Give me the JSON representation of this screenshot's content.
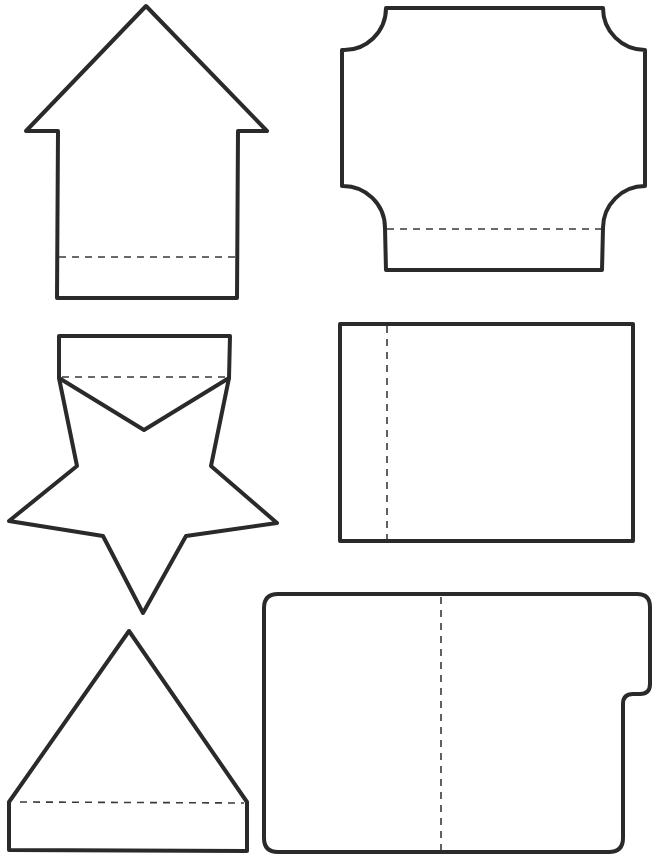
{
  "page": {
    "width": 652,
    "height": 854,
    "background": "#ffffff",
    "line_color": "#2a2a2a",
    "fold_color": "#3a3a3a"
  },
  "shapes": [
    {
      "name": "house-shape",
      "cut_path": "M 146 6 L 267 131 L 238 131 L 237 298 L 57 298 L 58 131 L 26 131 Z",
      "fold_lines": [
        {
          "x1": 59,
          "y1": 257,
          "x2": 236,
          "y2": 257
        }
      ]
    },
    {
      "name": "scalloped-rectangle-shape",
      "cut_path": "M 386 8 L 603 8 A 42 42 0 0 0 645 50 L 645 186 A 42 42 0 0 0 603 228 L 602 270 L 386 270 L 385 228 A 42 42 0 0 0 342 186 L 342 50 A 42 42 0 0 0 386 8 Z",
      "fold_lines": [
        {
          "x1": 387,
          "y1": 229,
          "x2": 601,
          "y2": 229
        }
      ]
    },
    {
      "name": "star-with-tab-shape",
      "cut_path": "M 59 336 L 230 336 L 229 378 L 211 466 L 277 523 L 186 536 L 143 613 L 103 536 L 9 521 L 77 466 L 59 378 Z",
      "inner_path": "M 59 378 L 144 430 L 229 378",
      "fold_lines": [
        {
          "x1": 62,
          "y1": 377,
          "x2": 226,
          "y2": 377
        }
      ]
    },
    {
      "name": "rectangle-shape",
      "cut_path": "M 340 324 L 633 324 L 633 541 L 340 541 Z",
      "fold_lines": [
        {
          "x1": 387,
          "y1": 326,
          "x2": 387,
          "y2": 539
        }
      ]
    },
    {
      "name": "triangle-with-tab-shape",
      "cut_path": "M 129 631 L 247 802 L 247 851 L 9 850 L 9 802 Z",
      "fold_lines": [
        {
          "x1": 20,
          "y1": 802,
          "x2": 244,
          "y2": 803
        }
      ]
    },
    {
      "name": "file-folder-shape",
      "cut_path": "M 278 594 L 637 594 Q 650 594 650 607 L 650 684 Q 650 694 640 694 L 633 694 Q 623 694 623 704 L 623 838 Q 623 852 609 852 L 278 852 Q 264 852 264 838 L 264 608 Q 264 594 278 594 Z",
      "fold_lines": [
        {
          "x1": 441,
          "y1": 597,
          "x2": 441,
          "y2": 850
        }
      ]
    }
  ]
}
